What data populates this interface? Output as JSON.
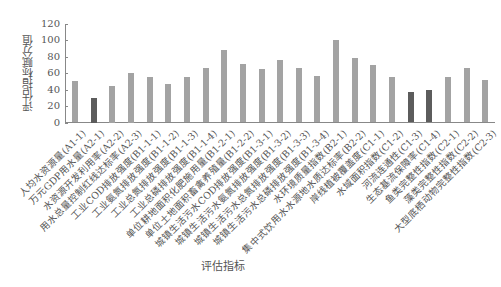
{
  "chart_data": {
    "type": "bar",
    "title": "",
    "xlabel": "评估指标",
    "ylabel": "评估指标赋分值",
    "ylim": [
      0,
      120
    ],
    "yticks": [
      0,
      20,
      40,
      60,
      80,
      100,
      120
    ],
    "grid": false,
    "legend": null,
    "categories": [
      "人均水资源量(A1-1)",
      "万元GDP用水量(A2-1)",
      "水资源开发利用率(A2-2)",
      "用水总量控制红线达标率(A2-3)",
      "工业COD排放强度(B1-1-1)",
      "工业氨氮排放强度(B1-1-2)",
      "工业总氮排放强度(B1-1-3)",
      "工业总磷排放强度(B1-1-4)",
      "单位耕地面积化肥施用量(B1-2-1)",
      "单位土地面积畜禽养殖量(B1-2-2)",
      "城镇生活污水COD排放强度(B1-3-1)",
      "城镇生活污水氨氮排放强度(B1-3-2)",
      "城镇生活污水总氮排放强度(B1-3-3)",
      "城镇生活污水总磷排放强度(B1-3-4)",
      "水环境质量指数(B2-1)",
      "集中式饮用水水源地水质达标率(B2-2)",
      "岸线植被覆盖度(C1-1)",
      "水域面积指数(C1-2)",
      "河流连通性(C1-3)",
      "生态基流保障率(C1-4)",
      "鱼类完整性指数(C2-1)",
      "藻类完整性指数(C2-2)",
      "大型底栖动物完整性指数(C2-3)"
    ],
    "values": [
      50,
      30,
      45,
      60,
      55,
      47,
      55,
      66,
      88,
      71,
      65,
      76,
      66,
      57,
      100,
      79,
      70,
      55,
      37,
      40,
      55,
      66,
      52
    ],
    "highlight_indices": [
      1,
      18,
      19
    ],
    "colors": {
      "normal": "#a3a3a3",
      "highlight": "#5c5c5c",
      "axis": "#888888"
    }
  }
}
